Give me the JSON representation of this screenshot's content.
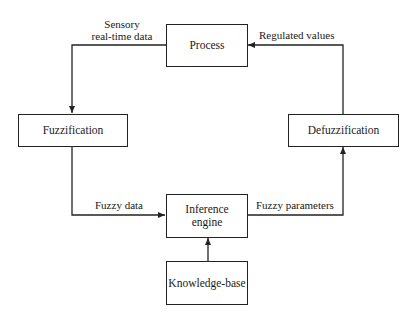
{
  "diagram": {
    "nodes": {
      "process": "Process",
      "fuzzification": "Fuzzification",
      "defuzzification": "Defuzzification",
      "inference_line1": "Inference",
      "inference_line2": "engine",
      "knowledge_base": "Knowledge-base"
    },
    "edges": {
      "sensory_line1": "Sensory",
      "sensory_line2": "real-time data",
      "regulated": "Regulated values",
      "fuzzy_data": "Fuzzy data",
      "fuzzy_parameters": "Fuzzy parameters"
    },
    "colors": {
      "stroke": "#222222",
      "background": "#ffffff"
    }
  }
}
